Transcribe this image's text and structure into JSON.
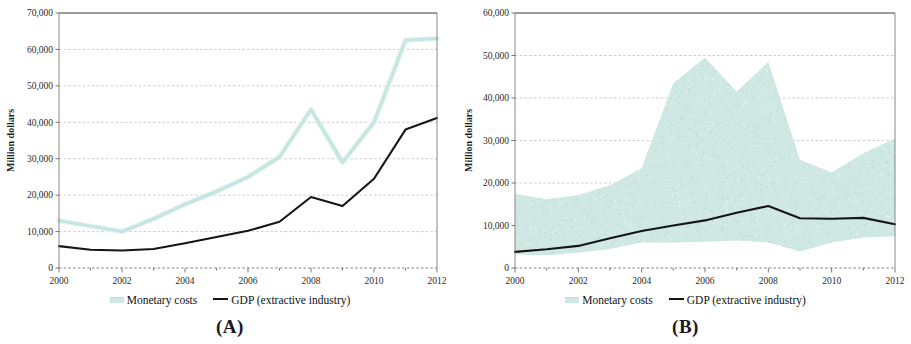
{
  "figure": {
    "panels": [
      {
        "id": "A",
        "caption": "(A)",
        "legend": [
          {
            "name": "monetary-costs",
            "label": "Monetary costs",
            "style": "band",
            "color": "#cfe8e4"
          },
          {
            "name": "gdp",
            "label": "GDP (extractive industry)",
            "style": "line",
            "color": "#151515"
          }
        ]
      },
      {
        "id": "B",
        "caption": "(B)",
        "legend": [
          {
            "name": "monetary-costs",
            "label": "Monetary costs",
            "style": "band",
            "color": "#cfe8e4"
          },
          {
            "name": "gdp",
            "label": "GDP (extractive industry)",
            "style": "line",
            "color": "#151515"
          }
        ]
      }
    ]
  },
  "chart_data": [
    {
      "type": "line",
      "panel": "A",
      "title": "",
      "xlabel": "",
      "ylabel": "Million dollars",
      "x": [
        2000,
        2001,
        2002,
        2003,
        2004,
        2005,
        2006,
        2007,
        2008,
        2009,
        2010,
        2011,
        2012
      ],
      "xlim": [
        2000,
        2012
      ],
      "ylim": [
        0,
        70000
      ],
      "yticks": [
        0,
        10000,
        20000,
        30000,
        40000,
        50000,
        60000,
        70000
      ],
      "ytick_labels": [
        "0",
        "10,000",
        "20,000",
        "30,000",
        "40,000",
        "50,000",
        "60,000",
        "70,000"
      ],
      "xticks": [
        2000,
        2002,
        2004,
        2006,
        2008,
        2010,
        2012
      ],
      "xtick_labels": [
        "2000",
        "2002",
        "2004",
        "2006",
        "2008",
        "2010",
        "2012"
      ],
      "grid": true,
      "legend_position": "below",
      "series": [
        {
          "name": "Monetary costs",
          "color": "#bfe3de",
          "values": [
            13000,
            11500,
            10000,
            13500,
            17500,
            21000,
            25000,
            30500,
            43500,
            29000,
            40000,
            62500,
            63000
          ]
        },
        {
          "name": "GDP (extractive industry)",
          "color": "#151515",
          "values": [
            6000,
            5000,
            4800,
            5200,
            6800,
            8500,
            10200,
            12700,
            19500,
            17000,
            24500,
            38000,
            41200
          ]
        }
      ]
    },
    {
      "type": "area",
      "panel": "B",
      "title": "",
      "xlabel": "",
      "ylabel": "Million dollars",
      "x": [
        2000,
        2001,
        2002,
        2003,
        2004,
        2005,
        2006,
        2007,
        2008,
        2009,
        2010,
        2011,
        2012
      ],
      "xlim": [
        2000,
        2012
      ],
      "ylim": [
        0,
        60000
      ],
      "yticks": [
        0,
        10000,
        20000,
        30000,
        40000,
        50000,
        60000
      ],
      "ytick_labels": [
        "0",
        "10,000",
        "20,000",
        "30,000",
        "40,000",
        "50,000",
        "60,000"
      ],
      "xticks": [
        2000,
        2002,
        2004,
        2006,
        2008,
        2010,
        2012
      ],
      "xtick_labels": [
        "2000",
        "2002",
        "2004",
        "2006",
        "2008",
        "2010",
        "2012"
      ],
      "grid": true,
      "legend_position": "below",
      "series": [
        {
          "name": "Monetary costs",
          "color": "#cfe8e4",
          "kind": "band",
          "upper": [
            17500,
            16200,
            17200,
            19500,
            23500,
            43500,
            49500,
            41500,
            48500,
            25500,
            22500,
            27000,
            30500
          ],
          "lower": [
            3200,
            3000,
            3600,
            4500,
            6000,
            6000,
            6200,
            6500,
            6000,
            3900,
            6000,
            7200,
            7500
          ]
        },
        {
          "name": "GDP (extractive industry)",
          "color": "#151515",
          "kind": "line",
          "values": [
            3800,
            4400,
            5200,
            7000,
            8700,
            10000,
            11200,
            13000,
            14600,
            11700,
            11600,
            11800,
            10300
          ]
        }
      ]
    }
  ]
}
